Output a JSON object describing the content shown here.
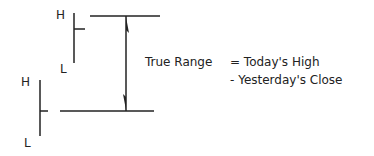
{
  "diagram": {
    "title": "True Range",
    "today_bar": {
      "high_label": "H",
      "low_label": "L"
    },
    "yesterday_bar": {
      "high_label": "H",
      "low_label": "L"
    },
    "formula": {
      "lhs": "True Range",
      "line1": "= Today's High",
      "line2": "- Yesterday's Close"
    },
    "colors": {
      "stroke": "#222222",
      "background": "#ffffff"
    }
  }
}
